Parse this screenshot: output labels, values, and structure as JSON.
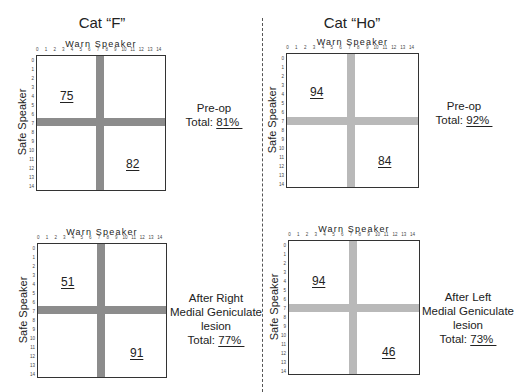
{
  "chart_data": {
    "type": "heatmap",
    "xlabel": "Warn Speaker",
    "ylabel": "Safe Speaker",
    "x_ticks": [
      "0",
      "1",
      "2",
      "3",
      "4",
      "5",
      "6",
      "7",
      "8",
      "9",
      "10",
      "11",
      "12",
      "13",
      "14"
    ],
    "y_ticks": [
      "0",
      "1",
      "2",
      "3",
      "4",
      "5",
      "6",
      "7",
      "8",
      "9",
      "10",
      "11",
      "12",
      "13",
      "14"
    ],
    "boundary": {
      "warn": 7,
      "safe": 7
    },
    "panels": [
      {
        "cat": "Cat “F”",
        "condition": "Pre-op",
        "upper_left": 75,
        "lower_right": 82,
        "total_pct": 81
      },
      {
        "cat": "Cat “Ho”",
        "condition": "Pre-op",
        "upper_left": 94,
        "lower_right": 84,
        "total_pct": 92
      },
      {
        "cat": "Cat “F”",
        "condition": "After Right Medial Geniculate lesion",
        "upper_left": 51,
        "lower_right": 91,
        "total_pct": 77
      },
      {
        "cat": "Cat “Ho”",
        "condition": "After Left Medial Geniculate lesion",
        "upper_left": 94,
        "lower_right": 46,
        "total_pct": 73
      }
    ]
  },
  "titles": {
    "left": "Cat “F”",
    "right": "Cat “Ho”"
  },
  "axis": {
    "x_label": "Warn Speaker",
    "y_label": "Safe Speaker"
  },
  "ticks": [
    "0",
    "1",
    "2",
    "3",
    "4",
    "5",
    "6",
    "7",
    "8",
    "9",
    "10",
    "11",
    "12",
    "13",
    "14"
  ],
  "panels": [
    {
      "ul": "75",
      "lr": "82",
      "lines": [
        "Pre-op"
      ],
      "total_prefix": "Total: ",
      "total": "81% "
    },
    {
      "ul": "94",
      "lr": "84",
      "lines": [
        "Pre-op"
      ],
      "total_prefix": "Total: ",
      "total": "92% "
    },
    {
      "ul": "51",
      "lr": "91",
      "lines": [
        "After Right",
        "Medial Geniculate",
        "lesion"
      ],
      "total_prefix": "Total: ",
      "total": "77% "
    },
    {
      "ul": "94",
      "lr": "46",
      "lines": [
        "After Left",
        "Medial Geniculate",
        "lesion"
      ],
      "total_prefix": "Total: ",
      "total": "73% "
    }
  ],
  "colors": {
    "band_dark": "#8c8c8c",
    "band_light": "#b9b9b9",
    "border": "#333333"
  }
}
